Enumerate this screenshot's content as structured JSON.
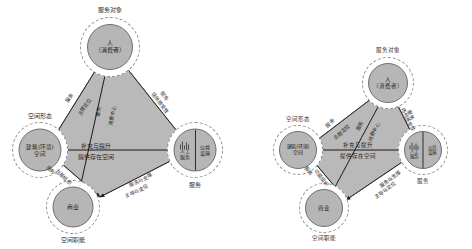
{
  "figure": {
    "background": "#ffffff",
    "polygon_fill": "#b9b9b9",
    "polygon_stroke": "#6a6a6a",
    "node_fill": "#b6b6b6",
    "node_stroke": "#6f6f6f",
    "ring_stroke": "#8d8d8d",
    "arrow_color": "#1a1a1a"
  },
  "nodes": {
    "consumer": {
      "label": "人\n（消费者）",
      "caption": "服务对象"
    },
    "space": {
      "label": "建筑(环境)\n空间",
      "caption": "空间形态"
    },
    "service": {
      "label_left": "人工\n服务",
      "label_right": "公共\n设施",
      "caption": "服务"
    },
    "commerce": {
      "label": "商业",
      "caption": "空间职能"
    }
  },
  "edges": {
    "space_to_consumer": {
      "line1": "服务",
      "line2": "主题定位"
    },
    "consumer_to_service": {
      "line1": "服务",
      "line2": "场所感受性"
    },
    "commerce_to_consumer": {
      "line1": "服务",
      "line2": "消费中心"
    },
    "space_to_service": {
      "line1": "补充与提升",
      "line2": "提供存在空间"
    },
    "commerce_to_service": {
      "line1": "服务与支撑",
      "line2": "主导与定位"
    },
    "space_to_commerce": {
      "line1": "服务",
      "line2": "功能组织"
    }
  },
  "diagrams": [
    {
      "id": "diagram-left",
      "name": "relationship-diagram-left"
    },
    {
      "id": "diagram-right",
      "name": "relationship-diagram-right"
    }
  ]
}
